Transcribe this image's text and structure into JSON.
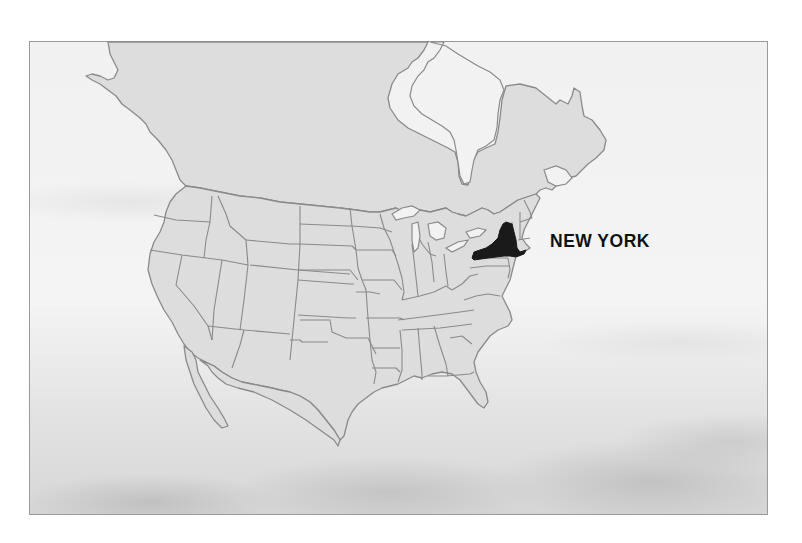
{
  "map": {
    "title_label": "NEW YORK",
    "highlighted_region": "New York",
    "region_type": "U.S. state",
    "colors": {
      "land_fill": "#dddddd",
      "border_stroke": "#8a8a8a",
      "highlight_fill": "#1a1a1a",
      "ocean_background": "#f2f2f2",
      "label_color": "#111111"
    }
  }
}
